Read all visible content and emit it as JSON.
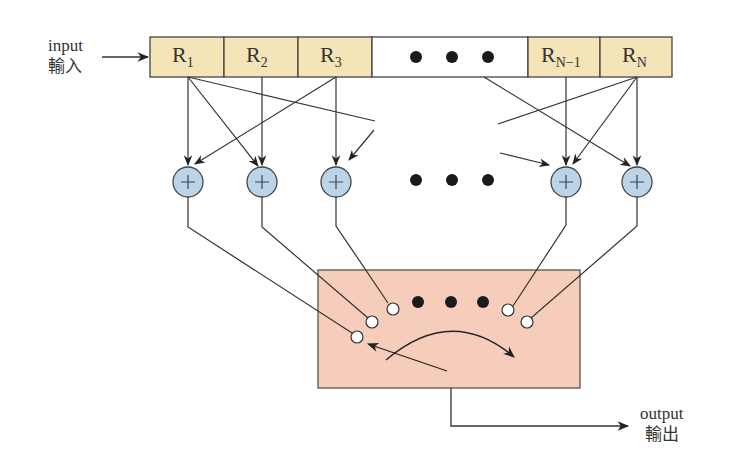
{
  "input": {
    "label": "input",
    "label_zh": "輸入"
  },
  "output": {
    "label": "output",
    "label_zh": "輸出"
  },
  "registers": [
    {
      "name": "R",
      "sub": "1"
    },
    {
      "name": "R",
      "sub": "2"
    },
    {
      "name": "R",
      "sub": "3"
    },
    {
      "name": "ellipsis",
      "sub": ""
    },
    {
      "name": "R",
      "sub": "N−1"
    },
    {
      "name": "R",
      "sub": "N"
    }
  ],
  "adders": [
    {
      "symbol": "+"
    },
    {
      "symbol": "+"
    },
    {
      "symbol": "+"
    },
    {
      "symbol": "+"
    },
    {
      "symbol": "+"
    }
  ],
  "colors": {
    "register_fill": "#f5e4b8",
    "ellipsis_cell_fill": "#ffffff",
    "adder_fill": "#bcd4e8",
    "commutator_fill": "#f6cdbb",
    "stroke": "#333333"
  }
}
